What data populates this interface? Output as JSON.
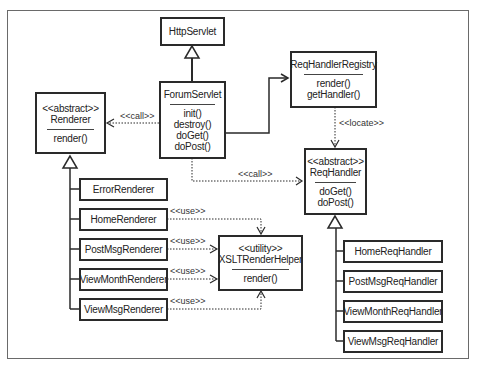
{
  "diagram": {
    "classes": {
      "http_servlet": {
        "name": "HttpServlet"
      },
      "forum_servlet": {
        "name": "ForumServlet",
        "methods": [
          "init()",
          "destroy()",
          "doGet()",
          "doPost()"
        ]
      },
      "renderer": {
        "stereotype": "<<abstract>>",
        "name": "Renderer",
        "methods": [
          "render()"
        ]
      },
      "req_handler_registry": {
        "name": "ReqHandlerRegistry",
        "methods": [
          "render()",
          "getHandler()"
        ]
      },
      "req_handler": {
        "stereotype": "<<abstract>>",
        "name": "ReqHandler",
        "methods": [
          "doGet()",
          "doPost()"
        ]
      },
      "xslt_render_helper": {
        "stereotype": "<<utility>>",
        "name": "XSLTRenderHelper",
        "methods": [
          "render()"
        ]
      },
      "renderers": [
        "ErrorRenderer",
        "HomeRenderer",
        "PostMsgRenderer",
        "ViewMonthRenderer",
        "ViewMsgRenderer"
      ],
      "req_handlers": [
        "HomeReqHandler",
        "PostMsgReqHandler",
        "ViewMonthReqHandler",
        "ViewMsgReqHandler"
      ]
    },
    "labels": {
      "call_renderer": "<<call>>",
      "call_req_handler": "<<call>>",
      "locate": "<<locate>>",
      "use": "<<use>>"
    },
    "relationships": [
      {
        "from": "ForumServlet",
        "to": "HttpServlet",
        "type": "generalization"
      },
      {
        "from": "ForumServlet",
        "to": "Renderer",
        "type": "dependency",
        "label": "<<call>>"
      },
      {
        "from": "ForumServlet",
        "to": "ReqHandlerRegistry",
        "type": "association"
      },
      {
        "from": "ForumServlet",
        "to": "ReqHandler",
        "type": "dependency",
        "label": "<<call>>"
      },
      {
        "from": "ReqHandlerRegistry",
        "to": "ReqHandler",
        "type": "dependency",
        "label": "<<locate>>"
      },
      {
        "from": "HomeRenderer",
        "to": "XSLTRenderHelper",
        "type": "dependency",
        "label": "<<use>>"
      },
      {
        "from": "PostMsgRenderer",
        "to": "XSLTRenderHelper",
        "type": "dependency",
        "label": "<<use>>"
      },
      {
        "from": "ViewMonthRenderer",
        "to": "XSLTRenderHelper",
        "type": "dependency",
        "label": "<<use>>"
      },
      {
        "from": "ViewMsgRenderer",
        "to": "XSLTRenderHelper",
        "type": "dependency",
        "label": "<<use>>"
      }
    ]
  }
}
